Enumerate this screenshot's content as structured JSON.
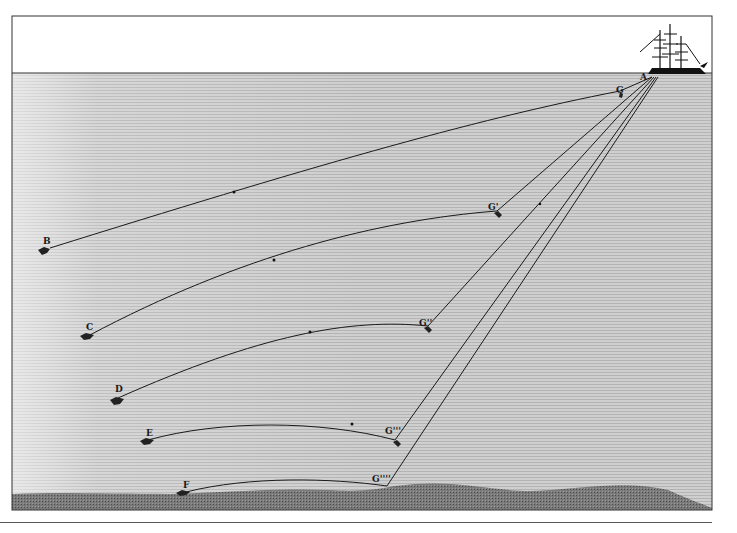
{
  "figure": {
    "colors": {
      "sky": "#ffffff",
      "sea": "#c9c9c9",
      "sea_light": "#e6e6e6",
      "seabed": "#6e6e6e",
      "line": "#1a1a1a",
      "frame": "#333333"
    },
    "labels": {
      "ship": "A",
      "g0": "G",
      "g1": "G'",
      "g2": "G''",
      "g3": "G'''",
      "g4": "G''''",
      "b": "B",
      "c": "C",
      "d": "D",
      "e": "E",
      "f": "F"
    }
  }
}
